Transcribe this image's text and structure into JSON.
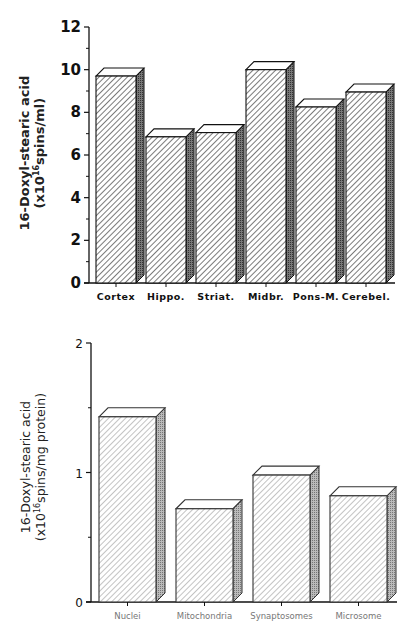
{
  "chart_data": [
    {
      "type": "bar",
      "style": "3d-hatched",
      "title": "",
      "categories": [
        "Cortex",
        "Hippo.",
        "Striat.",
        "Midbr.",
        "Pons-M.",
        "Cerebel."
      ],
      "values": [
        9.7,
        6.85,
        7.05,
        10.0,
        8.25,
        8.95
      ],
      "xlabel": "",
      "ylabel": "16-Doxyl-stearic acid (x10^16 spins/ml)",
      "ylabel_line1": "16-Doxyl-stearic acid",
      "ylabel_line2_prefix": "(x10",
      "ylabel_line2_sup": "16",
      "ylabel_line2_suffix": "spins/ml)",
      "ylim": [
        0,
        12
      ],
      "yticks": [
        0,
        2,
        4,
        6,
        8,
        10,
        12
      ],
      "minor_ticks": true,
      "grid": false,
      "legend": null
    },
    {
      "type": "bar",
      "style": "3d-hatched",
      "title": "",
      "categories": [
        "Nuclei",
        "Mitochondria",
        "Synaptosomes",
        "Microsome"
      ],
      "values": [
        1.43,
        0.72,
        0.98,
        0.82
      ],
      "xlabel": "",
      "ylabel": "16-Doxyl-stearic acid (x10^16 spins/mg protein)",
      "ylabel_line1": "16-Doxyl-stearic acid",
      "ylabel_line2_prefix": "(x10",
      "ylabel_line2_sup": "16",
      "ylabel_line2_suffix": "spins/mg protein)",
      "ylim": [
        0,
        2
      ],
      "yticks": [
        0,
        1,
        2
      ],
      "minor_ticks": true,
      "grid": false,
      "legend": null
    }
  ]
}
